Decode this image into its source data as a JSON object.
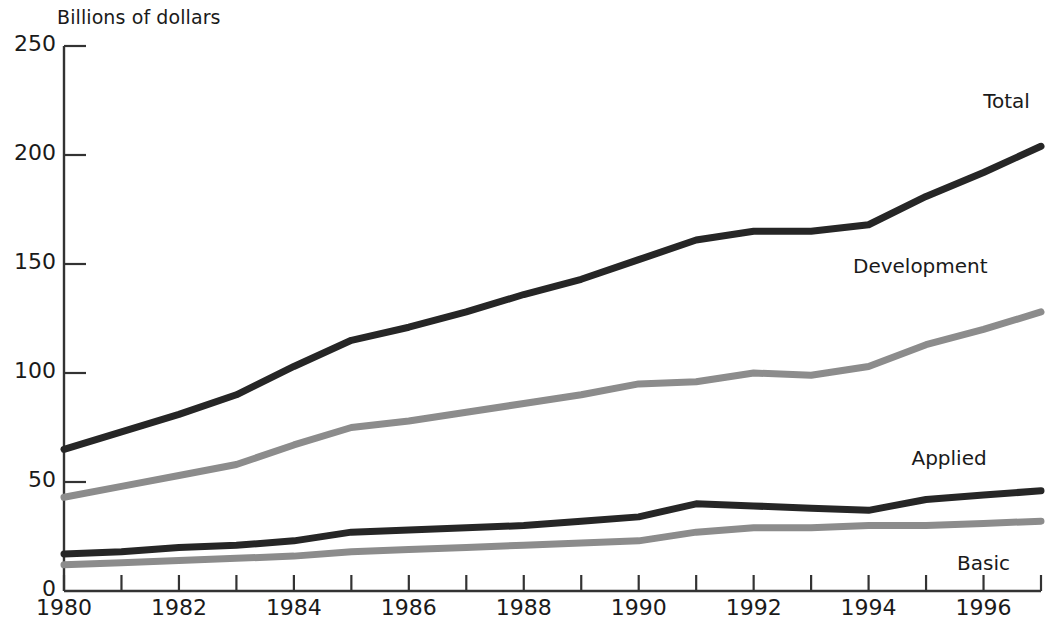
{
  "chart_data": {
    "type": "line",
    "title": "",
    "ylabel": "Billions of dollars",
    "xlabel": "",
    "ylim": [
      0,
      250
    ],
    "xlim": [
      1980,
      1997
    ],
    "yticks": [
      0,
      50,
      100,
      150,
      200,
      250
    ],
    "ytick_labels": [
      "0",
      "50",
      "100",
      "150",
      "200",
      "250"
    ],
    "xticks": [
      1980,
      1981,
      1982,
      1983,
      1984,
      1985,
      1986,
      1987,
      1988,
      1989,
      1990,
      1991,
      1992,
      1993,
      1994,
      1995,
      1996,
      1997
    ],
    "xtick_labels": [
      "1980",
      "1982",
      "1984",
      "1986",
      "1988",
      "1990",
      "1992",
      "1994",
      "1996"
    ],
    "xtick_labeled_years": [
      1980,
      1982,
      1984,
      1986,
      1988,
      1990,
      1992,
      1994,
      1996
    ],
    "grid": false,
    "legend_position": "inline-right",
    "x": [
      1980,
      1981,
      1982,
      1983,
      1984,
      1985,
      1986,
      1987,
      1988,
      1989,
      1990,
      1991,
      1992,
      1993,
      1994,
      1995,
      1996,
      1997
    ],
    "series": [
      {
        "name": "Total",
        "color": "#262626",
        "label_x": 1996.4,
        "label_y": 224,
        "values": [
          65,
          73,
          81,
          90,
          103,
          115,
          121,
          128,
          136,
          143,
          152,
          161,
          165,
          165,
          168,
          181,
          192,
          204
        ]
      },
      {
        "name": "Development",
        "color": "#8c8c8c",
        "label_x": 1994.9,
        "label_y": 148,
        "values": [
          43,
          48,
          53,
          58,
          67,
          75,
          78,
          82,
          86,
          90,
          95,
          96,
          100,
          99,
          103,
          113,
          120,
          128
        ]
      },
      {
        "name": "Applied",
        "color": "#262626",
        "label_x": 1995.4,
        "label_y": 60,
        "values": [
          17,
          18,
          20,
          21,
          23,
          27,
          28,
          29,
          30,
          32,
          34,
          40,
          39,
          38,
          37,
          42,
          44,
          46
        ]
      },
      {
        "name": "Basic",
        "color": "#8c8c8c",
        "label_x": 1996.0,
        "label_y": 12,
        "values": [
          12,
          13,
          14,
          15,
          16,
          18,
          19,
          20,
          21,
          22,
          23,
          27,
          29,
          29,
          30,
          30,
          31,
          32
        ]
      }
    ]
  }
}
